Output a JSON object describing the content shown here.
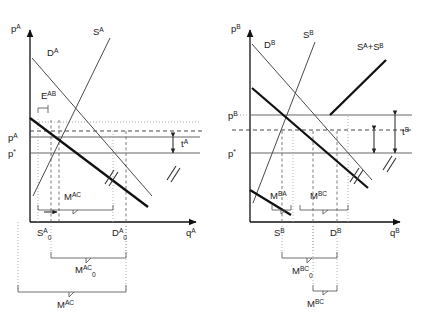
{
  "figure": {
    "panels": [
      {
        "id": "panel-a",
        "axis": {
          "y_label": "p",
          "y_sup": "A",
          "x_label": "q",
          "x_sup": "A"
        },
        "curves": [
          {
            "name": "demand-a",
            "label": "D",
            "sup": "A",
            "style": "thin"
          },
          {
            "name": "supply-a",
            "label": "S",
            "sup": "A",
            "style": "thin"
          },
          {
            "name": "excess-demand-ab",
            "label": "E",
            "sup": "AB",
            "style": "thick"
          }
        ],
        "price_labels": [
          {
            "name": "price-a",
            "label": "p",
            "sup": "A"
          },
          {
            "name": "world-price",
            "label": "p",
            "sup": "*"
          }
        ],
        "quantity_labels": [
          {
            "name": "supply-quantity-a0",
            "label": "S",
            "sup": "A",
            "sub": "0"
          },
          {
            "name": "demand-quantity-a0",
            "label": "D",
            "sup": "A",
            "sub": "0"
          }
        ],
        "gap_label": {
          "name": "tariff-a",
          "label": "t",
          "sup": "A"
        },
        "braces": [
          {
            "name": "brace-mac-inner",
            "label": "M",
            "sup": "AC",
            "sub": ""
          },
          {
            "name": "brace-mac-zero",
            "label": "M",
            "sup": "AC",
            "sub": "0"
          },
          {
            "name": "brace-mac-outer",
            "label": "M",
            "sup": "AC",
            "sub": ""
          }
        ]
      },
      {
        "id": "panel-b",
        "axis": {
          "y_label": "p",
          "y_sup": "B",
          "x_label": "q",
          "x_sup": "B"
        },
        "curves": [
          {
            "name": "demand-b",
            "label": "D",
            "sup": "B",
            "style": "thin"
          },
          {
            "name": "supply-b",
            "label": "S",
            "sup": "B",
            "style": "thin"
          },
          {
            "name": "combined-supply-ab",
            "label": "Sᴬ+Sᴮ",
            "sup": "",
            "style": "thick"
          }
        ],
        "price_labels": [
          {
            "name": "price-b",
            "label": "p",
            "sup": "B"
          },
          {
            "name": "world-price",
            "label": "p",
            "sup": "*"
          }
        ],
        "quantity_labels": [
          {
            "name": "supply-quantity-b",
            "label": "S",
            "sup": "B"
          },
          {
            "name": "demand-quantity-b",
            "label": "D",
            "sup": "B"
          }
        ],
        "gap_label": {
          "name": "tariff-b",
          "label": "t",
          "sup": "B"
        },
        "braces": [
          {
            "name": "brace-mba",
            "label": "M",
            "sup": "BA",
            "sub": ""
          },
          {
            "name": "brace-mbc-inner",
            "label": "M",
            "sup": "BC",
            "sub": ""
          },
          {
            "name": "brace-mbc-zero",
            "label": "M",
            "sup": "BC",
            "sub": "0"
          },
          {
            "name": "brace-mbc-outer",
            "label": "M",
            "sup": "BC",
            "sub": ""
          }
        ]
      }
    ],
    "text": {
      "p": "p",
      "q": "q",
      "D": "D",
      "S": "S",
      "E": "E",
      "M": "M",
      "t": "t",
      "A": "A",
      "B": "B",
      "AB": "AB",
      "AC": "AC",
      "BA": "BA",
      "BC": "BC",
      "star": "*",
      "zero": "0",
      "combined": "Sᴬ+Sᴮ"
    },
    "colors": {
      "background": "#ffffff",
      "axis": "#111111",
      "thin_curve": "#4a4a4a",
      "thick_curve": "#111111",
      "guide": "#888888",
      "text": "#1a1a1a"
    }
  }
}
